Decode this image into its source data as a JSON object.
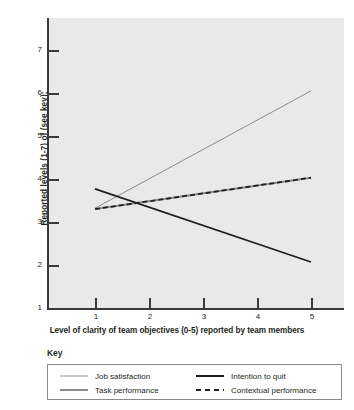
{
  "chart_data": {
    "type": "line",
    "title": "",
    "xlabel": "Level of clarity of team objectives (0-5) reported by team members",
    "ylabel": "Reported levels (1-7) of (see key):",
    "xlim": [
      0.3,
      5.5
    ],
    "ylim": [
      1,
      7.5
    ],
    "xticks": [
      1,
      2,
      3,
      4,
      5
    ],
    "xtick_labels": [
      "1",
      "2",
      "3",
      "4",
      "5"
    ],
    "yticks": [
      1,
      2,
      3,
      4,
      5,
      6,
      7
    ],
    "ytick_labels": [
      "1",
      "2",
      "3",
      "4",
      "5",
      "6",
      "7"
    ],
    "grid": false,
    "legend_position": "below-plot",
    "legend_title": "Key",
    "plot_background": "#e9e9e9",
    "x": [
      1,
      5
    ],
    "series": [
      {
        "name": "Job satisfaction",
        "values": [
          3.32,
          6.05
        ],
        "color": "#8c8c8c",
        "style": "solid",
        "width": 1.0
      },
      {
        "name": "Task performance",
        "values": [
          3.3,
          4.03
        ],
        "color": "#8c8c8c",
        "style": "solid",
        "width": 2.0
      },
      {
        "name": "Intention to quit",
        "values": [
          3.77,
          2.07
        ],
        "color": "#231f20",
        "style": "solid",
        "width": 1.8
      },
      {
        "name": "Contextual performance",
        "values": [
          3.3,
          4.03
        ],
        "color": "#231f20",
        "style": "dashed",
        "width": 1.8
      }
    ]
  },
  "axes": {
    "y_title": "Reported levels (1-7) of (see key):",
    "x_title": "Level of clarity of team objectives (0-5) reported by team members",
    "y_labels": {
      "t7": "7",
      "t6": "6",
      "t5": "5",
      "t4": "4",
      "t3": "3",
      "t2": "2",
      "t1": "1"
    },
    "x_labels": {
      "t1": "1",
      "t2": "2",
      "t3": "3",
      "t4": "4",
      "t5": "5"
    }
  },
  "key": {
    "title": "Key",
    "items": [
      {
        "label": "Job satisfaction"
      },
      {
        "label": "Task performance"
      },
      {
        "label": "Intention to quit"
      },
      {
        "label": "Contextual performance"
      }
    ]
  }
}
